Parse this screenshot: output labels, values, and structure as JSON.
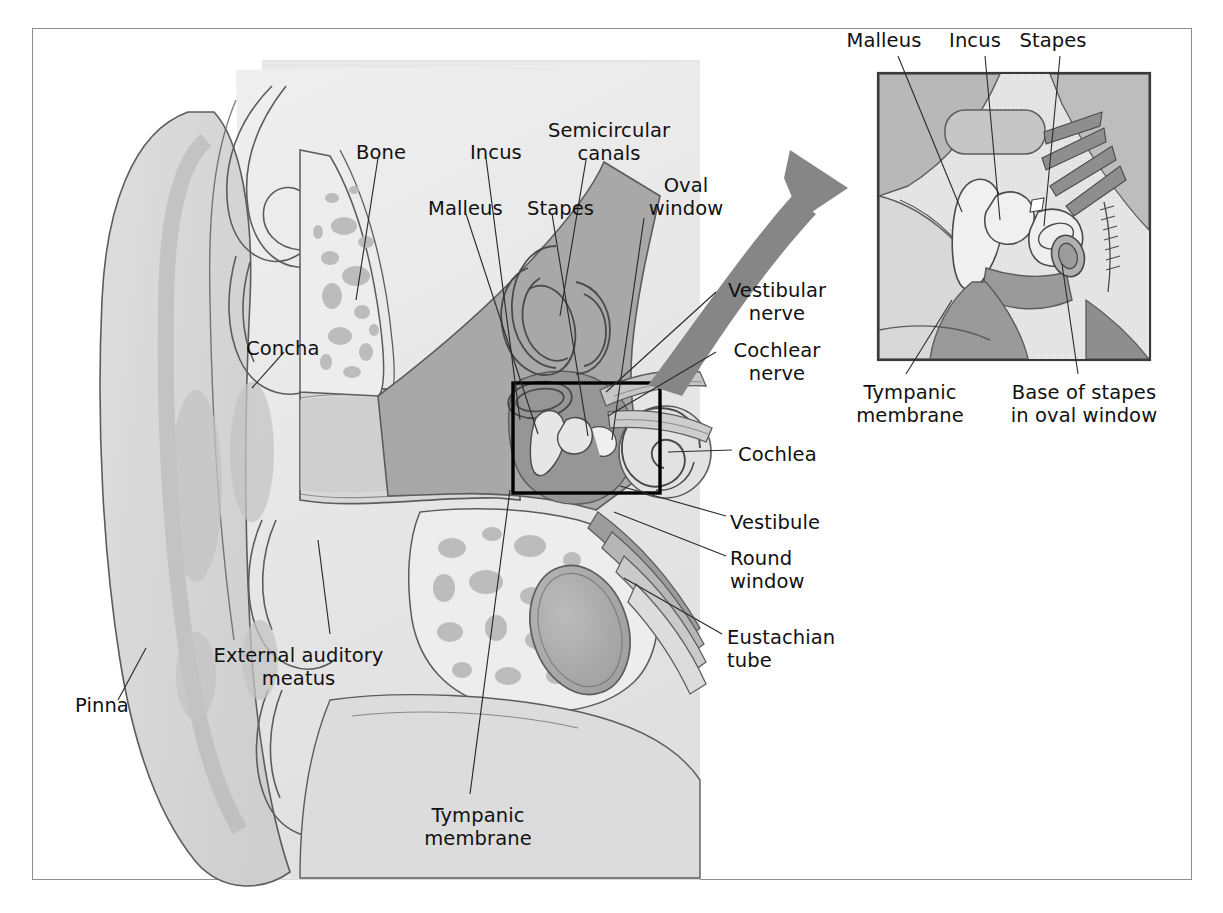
{
  "figure": {
    "type": "anatomical-diagram",
    "border_color": "#8e8e8e",
    "background": "#ffffff",
    "text_color": "#111111"
  },
  "palette": {
    "skin_light": "#e3e3e3",
    "skin_mid": "#d2d2d2",
    "skin_dark": "#bdbdbd",
    "cartilage": "#cccccc",
    "bone_fill": "#ececec",
    "bone_blob": "#bcbcbc",
    "tissue_dark": "#a0a0a0",
    "tissue_darker": "#8a8a8a",
    "outline": "#5c5c5c",
    "arrow": "#868686",
    "box_stroke": "#000000",
    "leader": "#2b2b2b"
  },
  "main_view": {
    "name": "ear-cross-section",
    "labels": [
      {
        "id": "bone",
        "text": "Bone",
        "x": 356,
        "y": 142,
        "align": "left"
      },
      {
        "id": "incus",
        "text": "Incus",
        "x": 470,
        "y": 142,
        "align": "left"
      },
      {
        "id": "semicircular",
        "text": "Semicircular\ncanals",
        "x": 544,
        "y": 120,
        "align": "center"
      },
      {
        "id": "malleus",
        "text": "Malleus",
        "x": 428,
        "y": 198,
        "align": "left"
      },
      {
        "id": "stapes",
        "text": "Stapes",
        "x": 527,
        "y": 198,
        "align": "left"
      },
      {
        "id": "oval-window",
        "text": "Oval\nwindow",
        "x": 640,
        "y": 175,
        "align": "center"
      },
      {
        "id": "vestibular-nerve",
        "text": "Vestibular\nnerve",
        "x": 722,
        "y": 280,
        "align": "left"
      },
      {
        "id": "cochlear-nerve",
        "text": "Cochlear\nnerve",
        "x": 722,
        "y": 340,
        "align": "left"
      },
      {
        "id": "cochlea",
        "text": "Cochlea",
        "x": 738,
        "y": 444,
        "align": "left"
      },
      {
        "id": "vestibule",
        "text": "Vestibule",
        "x": 730,
        "y": 512,
        "align": "left"
      },
      {
        "id": "round-window",
        "text": "Round\nwindow",
        "x": 730,
        "y": 548,
        "align": "left"
      },
      {
        "id": "eustachian-tube",
        "text": "Eustachian\ntube",
        "x": 727,
        "y": 627,
        "align": "left"
      },
      {
        "id": "concha",
        "text": "Concha",
        "x": 246,
        "y": 338,
        "align": "left"
      },
      {
        "id": "external-meatus",
        "text": "External auditory\nmeatus",
        "x": 297,
        "y": 645,
        "align": "center"
      },
      {
        "id": "pinna",
        "text": "Pinna",
        "x": 75,
        "y": 695,
        "align": "left"
      },
      {
        "id": "tympanic-membrane",
        "text": "Tympanic\nmembrane",
        "x": 478,
        "y": 805,
        "align": "center"
      }
    ]
  },
  "inset_view": {
    "name": "middle-ear-ossicles-detail",
    "frame": {
      "x": 878,
      "y": 73,
      "width": 272,
      "height": 287
    },
    "labels": [
      {
        "id": "inset-malleus",
        "text": "Malleus",
        "x": 883,
        "y": 40,
        "align": "center"
      },
      {
        "id": "inset-incus",
        "text": "Incus",
        "x": 975,
        "y": 40,
        "align": "center"
      },
      {
        "id": "inset-stapes",
        "text": "Stapes",
        "x": 1049,
        "y": 40,
        "align": "center"
      },
      {
        "id": "inset-tympanic",
        "text": "Tympanic\nmembrane",
        "x": 908,
        "y": 382,
        "align": "center"
      },
      {
        "id": "inset-base",
        "text": "Base of stapes\nin oval window",
        "x": 1083,
        "y": 382,
        "align": "center"
      }
    ]
  },
  "callout": {
    "name": "magnification-arrow",
    "description": "curved gray arrow from detail box to inset panel",
    "source_box": {
      "x": 513,
      "y": 383,
      "width": 147,
      "height": 110
    }
  }
}
